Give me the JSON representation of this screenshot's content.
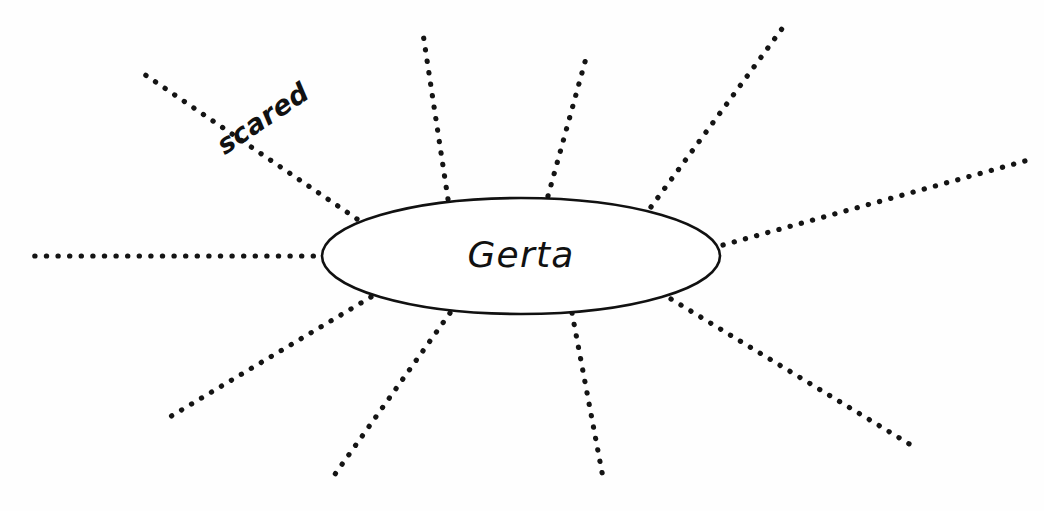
{
  "page": {
    "background_color": "#fefefe",
    "ink_color": "#111111",
    "width": 1044,
    "height": 511
  },
  "center_node": {
    "label": "Gerta",
    "shape": "ellipse",
    "cx": 521,
    "cy": 256,
    "rx": 199,
    "ry": 58,
    "fill": "#ffffff",
    "stroke": "#111111"
  },
  "branches": [
    {
      "id": "branch-left",
      "label": "",
      "direction": "left",
      "x1": 325,
      "y1": 256,
      "x2": 32,
      "y2": 256
    },
    {
      "id": "branch-upper-left",
      "label": "scared",
      "direction": "upper-left",
      "x1": 357,
      "y1": 219,
      "x2": 141,
      "y2": 72,
      "label_x": 268,
      "label_y": 126,
      "label_rotation": -34
    },
    {
      "id": "branch-top-left",
      "label": "",
      "direction": "top-left",
      "x1": 448,
      "y1": 199,
      "x2": 422,
      "y2": 27
    },
    {
      "id": "branch-top-right",
      "label": "",
      "direction": "top-right",
      "x1": 548,
      "y1": 196,
      "x2": 588,
      "y2": 51
    },
    {
      "id": "branch-upper-right",
      "label": "",
      "direction": "upper-right",
      "x1": 651,
      "y1": 207,
      "x2": 784,
      "y2": 26
    },
    {
      "id": "branch-right",
      "label": "",
      "direction": "right",
      "x1": 723,
      "y1": 245,
      "x2": 1025,
      "y2": 161
    },
    {
      "id": "branch-lower-right",
      "label": "",
      "direction": "lower-right",
      "x1": 671,
      "y1": 299,
      "x2": 911,
      "y2": 445
    },
    {
      "id": "branch-bottom-right",
      "label": "",
      "direction": "bottom-right",
      "x1": 572,
      "y1": 313,
      "x2": 604,
      "y2": 483
    },
    {
      "id": "branch-bottom-left",
      "label": "",
      "direction": "bottom-left",
      "x1": 450,
      "y1": 313,
      "x2": 333,
      "y2": 477
    },
    {
      "id": "branch-lower-left",
      "label": "",
      "direction": "lower-left",
      "x1": 371,
      "y1": 297,
      "x2": 163,
      "y2": 421
    }
  ],
  "counts": {
    "total_branches": 10,
    "labeled_branches": 1
  }
}
